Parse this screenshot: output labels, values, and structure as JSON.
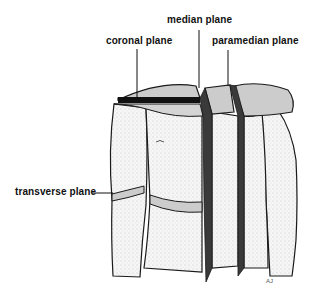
{
  "diagram": {
    "labels": {
      "median": "median plane",
      "coronal": "coronal plane",
      "paramedian": "paramedian plane",
      "transverse": "transverse plane"
    },
    "artist_mark": "AJ",
    "colors": {
      "outline": "#1a1a1a",
      "plane_fill": "#c8c8c8",
      "cut_dark": "#3a3a3a",
      "skin": "#f4f4f4"
    }
  }
}
